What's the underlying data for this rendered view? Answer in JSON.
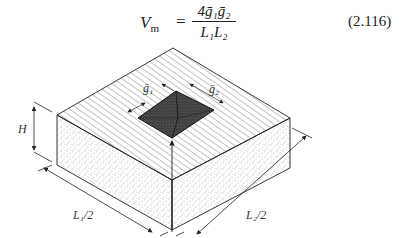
{
  "equation": {
    "lhs": "V",
    "lhs_sub": "m",
    "equals": "=",
    "numerator": "4ḡ₁ḡ₂",
    "denominator": "L₁L₂",
    "number": "(2.116)"
  },
  "figure": {
    "labels": {
      "height": "H",
      "g1": "ḡ₁",
      "g2": "ḡ₂",
      "l1_half": "L₁/2",
      "l2_half": "L₂/2"
    },
    "colors": {
      "line": "#222222",
      "hatch": "#555555",
      "pit": "#3a3a3a",
      "stipple": "#666666"
    }
  }
}
